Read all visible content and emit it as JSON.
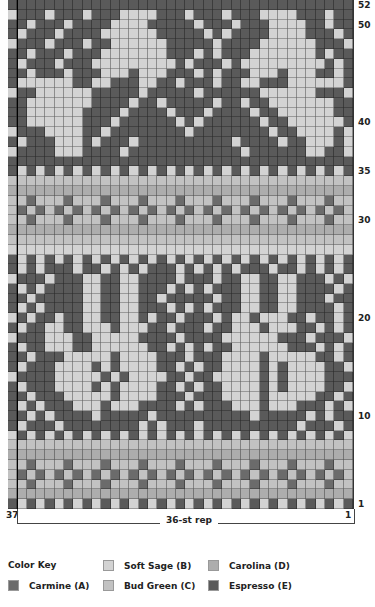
{
  "chart": {
    "columns": 37,
    "rows": 52,
    "rep_label": "36-st rep",
    "left_col_label": "37",
    "right_col_label": "1",
    "row_labels": [
      {
        "row": 52,
        "label": "52"
      },
      {
        "row": 50,
        "label": "50"
      },
      {
        "row": 40,
        "label": "40"
      },
      {
        "row": 35,
        "label": "35"
      },
      {
        "row": 30,
        "label": "30"
      },
      {
        "row": 20,
        "label": "20"
      },
      {
        "row": 10,
        "label": "10"
      },
      {
        "row": 1,
        "label": "1"
      }
    ],
    "grid_rows_top_to_bottom": [
      "EEEEEEEEEEEEEEEEEEEEEEEEEEEEEEEEEEEEE",
      "BEEEBEEEBEEEBBBBEEEBEEEBEEEBBBBEEEBEE",
      "EEBEEEBEEEEBBBBEEEEEBEEEBEEEBBBBEEBEE",
      "EBEEEBEEEEBBBBBBEEEEEBEBEEEEBBBBEEEBE",
      "BEEEBEEEBEEBBBBBBEEEEEBEEEEBBBBBBEEEB",
      "EEBEEEBEEEBBBBBBBEEEBEBEEEBBBBBBBEBEE",
      "EBEEEBEEEBBBBBBBBBEBEEEBEBBBBBBBBBEBE",
      "EEBEEEBEEEBBBEBBBEEEBEBEEEBBBEBBBEEBE",
      "EBBBBBBEEBBEEEBBEEBEEEBEEBBEEEBBBBBBE",
      "BEEBBBBBBEEEEEBEEEEEBEEEEEEBBBBBBEEEB",
      "EEBBBBBBBEEEEBEEBEEEEEBEEBEEBBBBBBBEE",
      "EEBBBBBBEEEEBEEEEBEEEBEEEEBEEBBBBBBEE",
      "EEBBBBBBEEEBEEEEEEBEBEEEEEEBEEBBBBBBE",
      "BEEEBBBBEEBEEEEEEEEBEEEEEEEEBEEBBBBEB",
      "EBEEEBBBEBEEEBEEEEEEEEEEBEEEEBEEBBBEB",
      "BEEEEBBBEEEEBEEEEEEEEEEEEBEEEEEEBBEEB",
      "EEEEEEEEEEEEEEEEEEEEEEEEEEEEEEEEEEEEE",
      "EBEBEBEBEBEBEBEBEBEBEBEBEBEBEBEBEBEBE",
      "CCCCCCCCCCCCCCCCCCCCCCCCCCCCCCCCCCCCC",
      "DDDDDDDDDDDDDDDDDDDDDDDDDDDDDDDDDDDDD",
      "CCACCCACCCACCCACCCACCCACCCACCCACCCACC",
      "CACACACACACACACACACACACACACACACACACAC",
      "CCACCCACCCACCCACCCACCCACCCACCCACCCACC",
      "DDDDDDDDDDDDDDDDDDDDDDDDDDDDDDDDDDDDD",
      "CCCCCCCCCCCCCCCCCCCCCCCCCCCCCCCCCCCCC",
      "BBBBBBBBBBBBBBBBBBBBBBBBBBBBBBBBBBBBB",
      "EBEBEBEBEBEBEBEBEBEBEBEBEBEBEBEBEBEBE",
      "EBEBEEEBEEBEBEBEEEBEBEBEBEEEBEEBEBEBE",
      "BEEEBEEEBBEEBBEEEEBEEEBEEBBEEBBEEEBEB",
      "EBEBEEEEBBEEBBEEEBEBEBEEEBBEEBBEEEEBE",
      "EEBEEEEEBBEEBBEEBEEEEEBEEBBEEBBEEEBEE",
      "EBEBEEEEBBEEBBEEEBEBEBEEEBBEEBBEEEEBE",
      "BEBEEBEEBBEEBBEBEEBEEEBEBBEBBBEEBEEBE",
      "EBEEBBEEBBBEBBBEEBEEEBEEBBBEBBBEEBEBE",
      "BEEEBBBEEBBBBBEEEEBEEEEBBBBBBEEEBEEEB",
      "EBEEBBBEEBBBBBBEEBEBEBEEBBBBBBEEEBEBE",
      "EEBEEEBBBBBEBBBBEEEBEEEBBBBEBBBBBEEBE",
      "EBEEEBBBBEBEBBBBEEBEBEEBBBBEBEBBBBEEB",
      "BEEEEBBBBBEBEBBBBEEBEEBBBBBEBEBBBBEEE",
      "EBEEEBBBBEBEBBBBEEBEBEEBBBBEBEBBBBEEB",
      "EEBEEEBBBBBEBBBBEEEBEEEBBBBEBBBBBEEBE",
      "EBEBEEEBBBEBBBEEEEBEBEEEBBBEBBBEEEBEB",
      "EEBEBEEEEBEEEEEBEEEEEEEEEEBEEEEEBEBEE",
      "EBEEEBEEEEEEEEBEBEEEBEEEEEEEEEEBEEEBE",
      "BEBEBEBEBEBEBEBEBEBEBEBEBEBEBEBEBEBEB",
      "CCCCCCCCCCCCCCCCCCCCCCCCCCCCCCCCCCCCC",
      "DDDDDDDDDDDDDDDDDDDDDDDDDDDDDDDDDDDDD",
      "CCACCCACCCACCCACCCACCCACCCACCCACCCACC",
      "CACACACACACACACACACACACACACACACACACAC",
      "CCACCCACCCACCCACCCACCCACCCACCCACCCACC",
      "DDDDDDDDDDDDDDDDDDDDDDDDDDDDDDDDDDDDD",
      "EBEBEBEBEBEBEBEBEBEBEBEBEBEBEBEBEBEBE"
    ]
  },
  "color_key": {
    "title": "Color Key",
    "items": [
      {
        "code": "A",
        "label": "Carmine (A)",
        "color": "#6b6b6b"
      },
      {
        "code": "B",
        "label": "Soft Sage (B)",
        "color": "#d3d3d3"
      },
      {
        "code": "C",
        "label": "Bud Green (C)",
        "color": "#c2c2c2"
      },
      {
        "code": "D",
        "label": "Carolina (D)",
        "color": "#adadad"
      },
      {
        "code": "E",
        "label": "Espresso (E)",
        "color": "#5a5a5a"
      }
    ]
  }
}
